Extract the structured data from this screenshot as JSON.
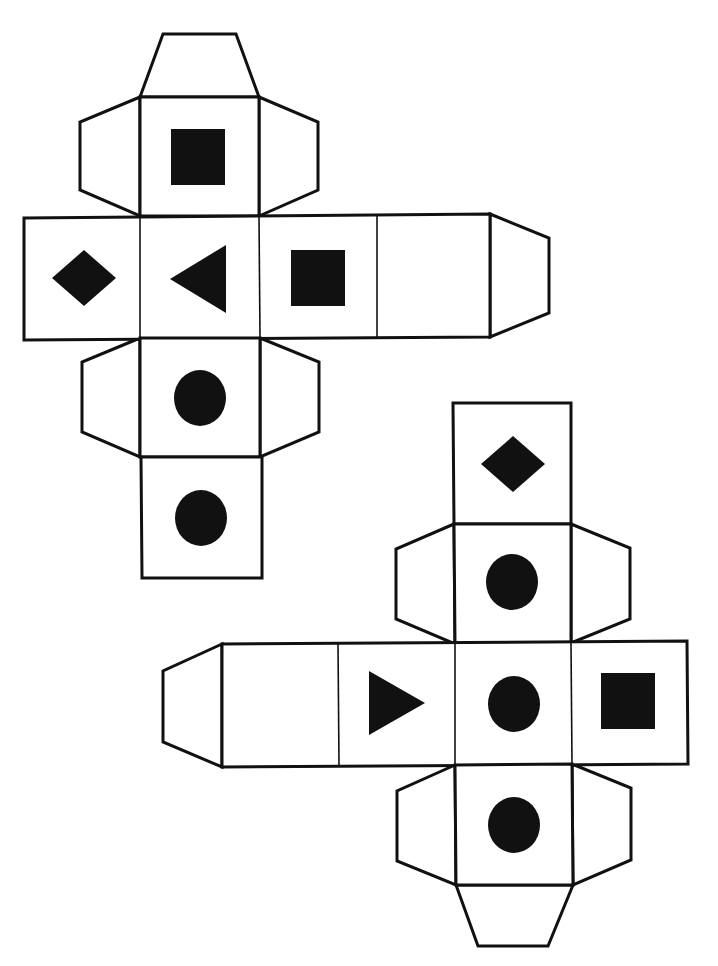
{
  "diagram": {
    "type": "cube-nets",
    "colors": {
      "ink": "#111111",
      "paper": "#ffffff"
    },
    "nets": [
      {
        "id": "net-1",
        "faces": [
          {
            "name": "top",
            "symbol": "square"
          },
          {
            "name": "left",
            "symbol": "diamond"
          },
          {
            "name": "center",
            "symbol": "triangle-left"
          },
          {
            "name": "right-1",
            "symbol": "square"
          },
          {
            "name": "right-2",
            "symbol": "blank"
          },
          {
            "name": "below-center",
            "symbol": "circle"
          },
          {
            "name": "bottom",
            "symbol": "circle"
          }
        ],
        "tabs": [
          "top-tab",
          "top-left-tab",
          "top-right-tab",
          "right-end-tab",
          "lower-left-tab",
          "lower-right-tab"
        ]
      },
      {
        "id": "net-2",
        "faces": [
          {
            "name": "top",
            "symbol": "diamond"
          },
          {
            "name": "upper",
            "symbol": "circle"
          },
          {
            "name": "left-2",
            "symbol": "blank"
          },
          {
            "name": "left-1",
            "symbol": "triangle-right"
          },
          {
            "name": "center",
            "symbol": "circle"
          },
          {
            "name": "right",
            "symbol": "square"
          },
          {
            "name": "lower",
            "symbol": "circle"
          }
        ],
        "tabs": [
          "left-end-tab",
          "upper-left-tab",
          "upper-right-tab",
          "lower-left-tab",
          "lower-right-tab",
          "bottom-tab"
        ]
      }
    ]
  }
}
